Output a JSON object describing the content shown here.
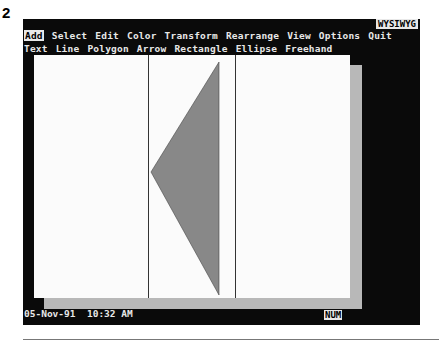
{
  "figure": {
    "number": "2"
  },
  "menu": {
    "items": [
      {
        "label": "Add",
        "active": true
      },
      {
        "label": "Select"
      },
      {
        "label": "Edit"
      },
      {
        "label": "Color"
      },
      {
        "label": "Transform"
      },
      {
        "label": "Rearrange"
      },
      {
        "label": "View"
      },
      {
        "label": "Options"
      },
      {
        "label": "Quit"
      }
    ],
    "mode_indicator": "WYSIWYG"
  },
  "submenu": {
    "items": [
      {
        "label": "Text"
      },
      {
        "label": "Line"
      },
      {
        "label": "Polygon"
      },
      {
        "label": "Arrow"
      },
      {
        "label": "Rectangle"
      },
      {
        "label": "Ellipse"
      },
      {
        "label": "Freehand"
      }
    ]
  },
  "canvas": {
    "background": "#fbfbfb",
    "shadow_color": "#b8b8b8",
    "triangle_fill": "#888888"
  },
  "status": {
    "date": "05-Nov-91",
    "time": "10:32 AM",
    "num_indicator": "NUM"
  }
}
